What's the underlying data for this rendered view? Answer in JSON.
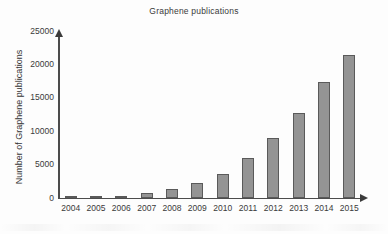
{
  "chart_data": {
    "type": "bar",
    "title": "Graphene publications",
    "xlabel": "",
    "ylabel": "Number of Graphene publications",
    "categories": [
      "2004",
      "2005",
      "2006",
      "2007",
      "2008",
      "2009",
      "2010",
      "2011",
      "2012",
      "2013",
      "2014",
      "2015"
    ],
    "values": [
      100,
      200,
      300,
      650,
      1300,
      2150,
      3550,
      5900,
      8900,
      12600,
      17300,
      21400
    ],
    "ylim": [
      0,
      25000
    ],
    "yticks": [
      0,
      5000,
      10000,
      15000,
      20000,
      25000
    ],
    "ytick_labels": [
      "0",
      "5000",
      "10000",
      "15000",
      "20000",
      "25000"
    ],
    "grid": false,
    "legend": null,
    "bar_color": "#949494",
    "bar_edge_color": "#5a5a5a",
    "axis_color": "#4c4c4c",
    "text_color": "#3a3a3a",
    "background": "#fdfdfd",
    "axis_style": "arrow-tipped two-spine (left and bottom)"
  }
}
